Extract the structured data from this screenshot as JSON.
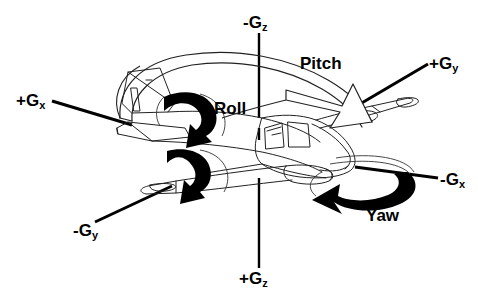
{
  "figure": {
    "background_color": "#ffffff",
    "stroke_color": "#000000",
    "fill_color": "#000000",
    "width": 478,
    "height": 298
  },
  "axes": {
    "items": [
      {
        "key": "neg_gz",
        "label": "-G",
        "subscript": "z",
        "position": "top-center",
        "description": "negative vertical axis label above aircraft"
      },
      {
        "key": "pos_gz",
        "label": "+G",
        "subscript": "z",
        "position": "bottom-center",
        "description": "positive vertical axis label below aircraft"
      },
      {
        "key": "pos_gx",
        "label": "+G",
        "subscript": "x",
        "position": "left",
        "description": "positive longitudinal axis label at tail, left side"
      },
      {
        "key": "neg_gx",
        "label": "-G",
        "subscript": "x",
        "position": "right",
        "description": "negative longitudinal axis label at nose, right side"
      },
      {
        "key": "pos_gy",
        "label": "+G",
        "subscript": "y",
        "position": "top-right",
        "description": "positive lateral axis label at far wingtip"
      },
      {
        "key": "neg_gy",
        "label": "-G",
        "subscript": "y",
        "position": "bottom-left",
        "description": "negative lateral axis label at near wingtip"
      }
    ]
  },
  "rotations": {
    "items": [
      {
        "key": "roll",
        "label": "Roll",
        "axis": "x",
        "arrow": "thick-black-curved-down-arrow"
      },
      {
        "key": "pitch",
        "label": "Pitch",
        "axis": "y",
        "arrow": "thin-outline-arc-arrow"
      },
      {
        "key": "yaw",
        "label": "Yaw",
        "axis": "z",
        "arrow": "thick-black-crescent-arrow"
      }
    ]
  },
  "icons": {
    "aircraft": "twin-engine-light-aircraft-outline",
    "z_axis": "vertical-axis-line",
    "leader_lines": "label-leader-line"
  }
}
